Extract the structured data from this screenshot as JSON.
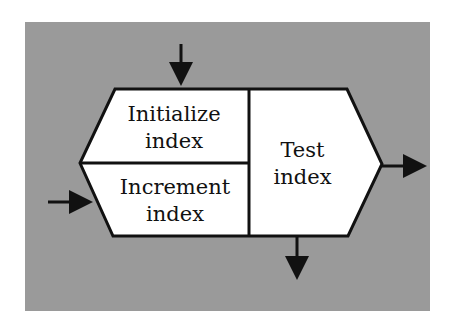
{
  "diagram": {
    "type": "loop-control-block",
    "boxes": [
      {
        "id": "initialize",
        "line1": "Initialize",
        "line2": "index"
      },
      {
        "id": "increment",
        "line1": "Increment",
        "line2": "index"
      },
      {
        "id": "test",
        "line1": "Test",
        "line2": "index"
      }
    ],
    "arrows": [
      {
        "id": "entry-top",
        "direction": "down",
        "target": "initialize"
      },
      {
        "id": "entry-left",
        "direction": "right",
        "target": "increment"
      },
      {
        "id": "exit-right",
        "direction": "right",
        "source": "test"
      },
      {
        "id": "exit-bottom",
        "direction": "down",
        "source": "test"
      }
    ],
    "colors": {
      "background": "#9a9a9a",
      "box_fill": "#ffffff",
      "stroke": "#111111"
    }
  }
}
